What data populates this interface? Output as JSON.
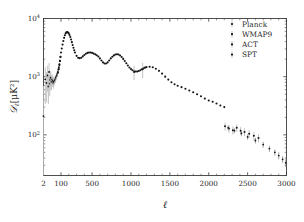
{
  "figure": {
    "background_color": "#ffffff",
    "frame_color": "#3d3d3d",
    "marker_color": "#141414",
    "errorbar_color": "#b9b9b9"
  },
  "axes": {
    "x_title": "ℓ",
    "y_title_parts": {
      "script_d": "𝒟",
      "subscript_ell": "ℓ",
      "units": "[μK²]"
    },
    "x_tick_labels": [
      "2",
      "100",
      "500",
      "1000",
      "1500",
      "2000",
      "2500",
      "3000"
    ],
    "y_tick_labels": [
      "10⁴",
      "10³",
      "10²"
    ],
    "y_tick_base": "10",
    "y_tick_exponents": [
      "4",
      "3",
      "2"
    ]
  },
  "legend": {
    "entries": [
      {
        "label": "Planck",
        "marker": "point-with-errorbar"
      },
      {
        "label": "WMAP9",
        "marker": "point-with-errorbar"
      },
      {
        "label": "ACT",
        "marker": "point-with-errorbar"
      },
      {
        "label": "SPT",
        "marker": "point-with-errorbar"
      }
    ]
  },
  "chart_data": {
    "type": "scatter",
    "title": "",
    "xlabel": "ℓ",
    "ylabel": "𝒟ℓ[μK²]",
    "xscale": "hybrid-log-linear",
    "yscale": "log",
    "xlim": [
      2,
      3000
    ],
    "ylim": [
      20,
      10000
    ],
    "grid": false,
    "legend_position": "upper-right",
    "xticks": [
      2,
      100,
      500,
      1000,
      1500,
      2000,
      2500,
      3000
    ],
    "yticks": [
      100,
      1000,
      10000
    ],
    "series": [
      {
        "name": "WMAP9",
        "comment": "low-multipole points, large scatter and error bars",
        "x": [
          2,
          3,
          4,
          5,
          6,
          7,
          8,
          9,
          10,
          12,
          14,
          16,
          18,
          20,
          24,
          28,
          32,
          36,
          40,
          45,
          50,
          56,
          62,
          70,
          78,
          88
        ],
        "y": [
          210,
          900,
          780,
          1050,
          680,
          1200,
          760,
          880,
          960,
          820,
          900,
          850,
          780,
          820,
          860,
          900,
          960,
          1010,
          1060,
          1130,
          1210,
          1320,
          1450,
          1640,
          1880,
          2180
        ],
        "yerr": [
          480,
          560,
          420,
          500,
          340,
          520,
          300,
          300,
          280,
          230,
          200,
          180,
          160,
          150,
          130,
          120,
          110,
          105,
          100,
          95,
          92,
          90,
          92,
          95,
          100,
          110
        ]
      },
      {
        "name": "Planck",
        "comment": "dense points tracing acoustic peaks from l~50 to l~2000",
        "x": [
          50,
          60,
          70,
          80,
          90,
          100,
          110,
          120,
          130,
          140,
          150,
          160,
          170,
          180,
          190,
          200,
          210,
          220,
          230,
          240,
          250,
          260,
          270,
          280,
          300,
          320,
          340,
          360,
          380,
          400,
          420,
          440,
          460,
          480,
          500,
          520,
          540,
          560,
          580,
          600,
          620,
          640,
          660,
          680,
          700,
          720,
          740,
          760,
          780,
          800,
          820,
          840,
          860,
          880,
          900,
          920,
          940,
          960,
          980,
          1000,
          1020,
          1040,
          1060,
          1080,
          1100,
          1120,
          1140,
          1160,
          1180,
          1200,
          1240,
          1280,
          1320,
          1360,
          1400,
          1440,
          1480,
          1520,
          1560,
          1600,
          1650,
          1700,
          1750,
          1800,
          1850,
          1900,
          1950,
          2000,
          2050,
          2100,
          2150,
          2200
        ],
        "y": [
          1180,
          1350,
          1580,
          1860,
          2200,
          2600,
          3050,
          3560,
          4100,
          4650,
          5150,
          5550,
          5780,
          5850,
          5760,
          5540,
          5200,
          4800,
          4360,
          3920,
          3500,
          3140,
          2840,
          2600,
          2280,
          2120,
          2080,
          2120,
          2230,
          2360,
          2480,
          2560,
          2600,
          2600,
          2560,
          2490,
          2420,
          2340,
          2220,
          2060,
          1900,
          1760,
          1680,
          1680,
          1760,
          1900,
          2060,
          2200,
          2320,
          2400,
          2430,
          2400,
          2310,
          2180,
          2020,
          1860,
          1700,
          1560,
          1440,
          1350,
          1290,
          1250,
          1230,
          1230,
          1250,
          1290,
          1340,
          1390,
          1430,
          1460,
          1480,
          1450,
          1370,
          1260,
          1130,
          1000,
          890,
          800,
          740,
          700,
          660,
          620,
          580,
          540,
          500,
          460,
          420,
          390,
          370,
          345,
          320,
          300
        ],
        "yerr": [
          40,
          38,
          36,
          36,
          36,
          36,
          36,
          38,
          40,
          42,
          45,
          48,
          50,
          50,
          50,
          48,
          46,
          44,
          42,
          40,
          38,
          36,
          34,
          33,
          31,
          30,
          29,
          29,
          30,
          31,
          32,
          33,
          33,
          33,
          33,
          32,
          32,
          31,
          30,
          29,
          28,
          27,
          27,
          27,
          28,
          29,
          30,
          31,
          32,
          33,
          33,
          33,
          32,
          31,
          30,
          29,
          28,
          27,
          26,
          26,
          25,
          25,
          25,
          25,
          25,
          26,
          26,
          27,
          27,
          28,
          28,
          28,
          27,
          26,
          25,
          24,
          23,
          22,
          22,
          21,
          21,
          20,
          20,
          19,
          19,
          18,
          18,
          18,
          17,
          17,
          17
        ]
      },
      {
        "name": "ACT",
        "comment": "scattered points with visible error bars in damping tail",
        "x": [
          1040,
          1150,
          2210,
          2260,
          2310,
          2360,
          2410,
          2460,
          2520,
          2580,
          2640
        ],
        "y": [
          1200,
          1340,
          140,
          128,
          120,
          132,
          118,
          112,
          104,
          96,
          88
        ],
        "yerr": [
          330,
          400,
          22,
          20,
          19,
          20,
          18,
          17,
          16,
          15,
          14
        ]
      },
      {
        "name": "SPT",
        "comment": "high-multipole tail points toward l=3000",
        "x": [
          2250,
          2330,
          2420,
          2500,
          2600,
          2700,
          2780,
          2850,
          2900,
          2950,
          2990
        ],
        "y": [
          132,
          118,
          106,
          92,
          80,
          68,
          58,
          50,
          44,
          38,
          33
        ],
        "yerr": [
          14,
          12,
          11,
          10,
          9,
          8,
          7,
          6,
          6,
          5,
          5
        ]
      }
    ]
  }
}
